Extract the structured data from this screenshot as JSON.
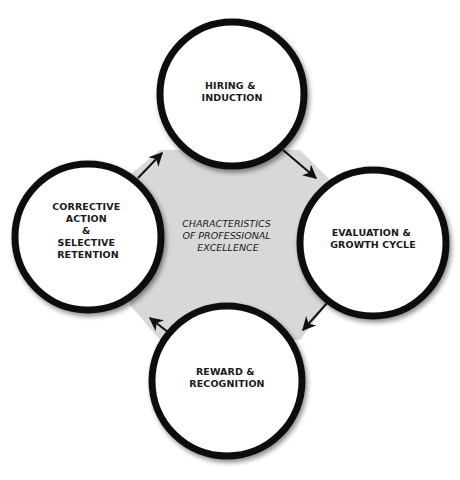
{
  "diagram": {
    "colors": {
      "background": "#ffffff",
      "center_fill": "#d8d8d8",
      "stroke": "#111111",
      "node_fill": "#ffffff"
    },
    "center": {
      "lines": [
        "CHARACTERISTICS",
        "OF PROFESSIONAL",
        "EXCELLENCE"
      ]
    },
    "nodes": [
      {
        "id": "hiring",
        "lines": [
          "HIRING &",
          "INDUCTION"
        ]
      },
      {
        "id": "evaluation",
        "lines": [
          "EVALUATION &",
          "GROWTH CYCLE"
        ]
      },
      {
        "id": "reward",
        "lines": [
          "REWARD &",
          "RECOGNITION"
        ]
      },
      {
        "id": "corrective",
        "lines": [
          "CORRECTIVE",
          "ACTION",
          "&",
          "SELECTIVE",
          "RETENTION"
        ]
      }
    ],
    "arrows": [
      {
        "from": "hiring",
        "to": "evaluation",
        "icon": "arrow-icon"
      },
      {
        "from": "evaluation",
        "to": "reward",
        "icon": "arrow-icon"
      },
      {
        "from": "reward",
        "to": "corrective",
        "icon": "arrow-icon"
      },
      {
        "from": "corrective",
        "to": "hiring",
        "icon": "arrow-icon"
      }
    ]
  }
}
